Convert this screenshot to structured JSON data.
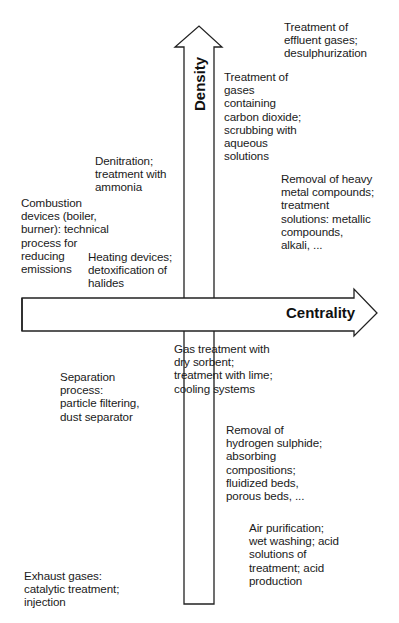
{
  "diagram": {
    "type": "quadrant",
    "axes": {
      "vertical": {
        "label": "Density",
        "direction": "up"
      },
      "horizontal": {
        "label": "Centrality",
        "direction": "right"
      }
    },
    "colors": {
      "stroke": "#222222",
      "text": "#1a1a1a",
      "background": "#ffffff"
    },
    "labels": [
      {
        "id": "effluent",
        "quadrant": "upper-right",
        "text": "Treatment of\neffluent gases;\ndesulphurization"
      },
      {
        "id": "co2",
        "quadrant": "upper-right",
        "text": "Treatment of\ngases\ncontaining\ncarbon dioxide;\nscrubbing with\naqueous\nsolutions"
      },
      {
        "id": "heavy-metal",
        "quadrant": "upper-right",
        "text": "Removal of heavy\nmetal compounds;\ntreatment\nsolutions: metallic\ncompounds,\nalkali, ..."
      },
      {
        "id": "denitration",
        "quadrant": "upper-left",
        "text": "Denitration;\ntreatment with\nammonia"
      },
      {
        "id": "combustion",
        "quadrant": "upper-left",
        "text": "Combustion\ndevices (boiler,\nburner): technical\nprocess for\nreducing\nemissions"
      },
      {
        "id": "heating",
        "quadrant": "upper-left",
        "text": "Heating devices;\ndetoxification of\nhalides"
      },
      {
        "id": "dry-sorbent",
        "quadrant": "lower-right",
        "text": "Gas treatment with\ndry sorbent;\ntreatment with lime;\ncooling systems"
      },
      {
        "id": "separation",
        "quadrant": "lower-left",
        "text": "Separation\nprocess:\nparticle filtering,\ndust separator"
      },
      {
        "id": "h2s",
        "quadrant": "lower-right",
        "text": "Removal of\nhydrogen sulphide;\nabsorbing\ncompositions;\nfluidized beds,\nporous beds, ..."
      },
      {
        "id": "air-purification",
        "quadrant": "lower-right",
        "text": "Air purification;\nwet washing; acid\nsolutions of\ntreatment; acid\nproduction"
      },
      {
        "id": "exhaust",
        "quadrant": "lower-left",
        "text": "Exhaust gases:\ncatalytic treatment;\ninjection"
      }
    ]
  }
}
